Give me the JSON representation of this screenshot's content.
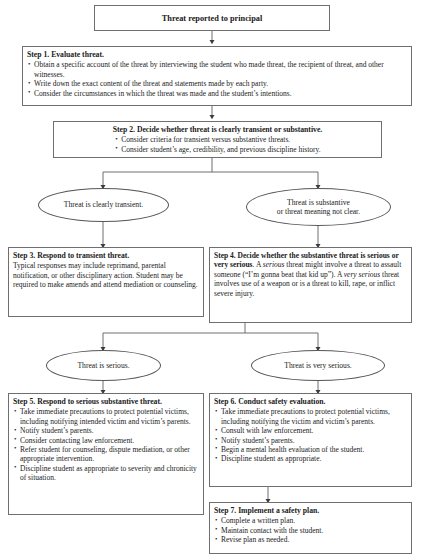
{
  "diagram": {
    "type": "flowchart",
    "colors": {
      "border": "#6f6f72",
      "background": "#ffffff",
      "text": "#1a1a1a"
    },
    "start": {
      "label": "Threat reported to principal"
    },
    "step1": {
      "heading": "Step 1. Evaluate threat.",
      "bullets": [
        "Obtain a specific account of the threat by interviewing the student who made threat, the recipient of threat, and other witnesses.",
        "Write down the exact content of the threat and statements made by each party.",
        "Consider the circumstances in which the threat was made and the student’s intentions."
      ]
    },
    "step2": {
      "heading": "Step 2. Decide whether threat is clearly transient or substantive.",
      "bullets": [
        "Consider criteria for transient versus substantive threats.",
        "Consider student’s age, credibility, and previous discipline history."
      ]
    },
    "decision1_left": {
      "label": "Threat is clearly transient."
    },
    "decision1_right": {
      "line1": "Threat is substantive",
      "line2": "or threat meaning not clear."
    },
    "step3": {
      "heading": "Step 3. Respond to transient threat.",
      "lines": [
        "Typical responses may include reprimand,",
        "parental notification, or other disciplinary action.",
        "Student may be required to make amends and",
        "attend mediation or counseling."
      ]
    },
    "step4": {
      "heading_line1": "Step 4. Decide whether the substantive",
      "heading_line2": "threat is serious or very serious",
      "text_a": ". A ",
      "em_a": "serious",
      "text_b": " threat might involve a threat to assault someone (“I’m gonna beat that kid up”). A ",
      "em_b": "very serious",
      "text_c": " threat involves use of a weapon or is a threat to kill, rape, or inflict severe injury."
    },
    "decision2_left": {
      "label": "Threat is serious."
    },
    "decision2_right": {
      "label": "Threat is very serious."
    },
    "step5": {
      "heading": "Step 5. Respond to serious substantive threat.",
      "bullets": [
        "Take immediate precautions to protect potential victims, including notifying intended victim and victim’s parents.",
        "Notify student’s parents.",
        "Consider contacting law enforcement.",
        "Refer student for counseling, dispute mediation, or other appropriate intervention.",
        "Discipline student as appropriate to severity and chronicity of situation."
      ]
    },
    "step6": {
      "heading": "Step 6. Conduct safety evaluation.",
      "bullets": [
        "Take immediate precautions to protect potential victims, including notifying the victim and victim’s parents.",
        "Consult with law enforcement.",
        "Notify student’s parents.",
        "Begin a mental health evaluation of the student.",
        "Discipline student as appropriate."
      ]
    },
    "step7": {
      "heading": "Step 7. Implement a safety plan.",
      "bullets": [
        "Complete a written plan.",
        "Maintain contact with the student.",
        "Revise plan as needed."
      ]
    }
  }
}
